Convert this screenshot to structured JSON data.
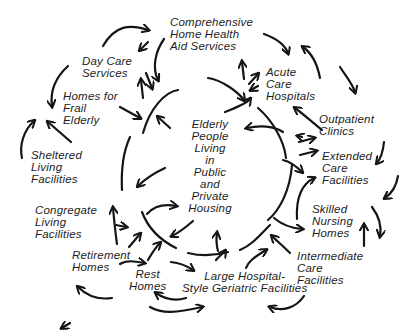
{
  "diagram": {
    "title": "",
    "center_node": {
      "id": "elderly-people",
      "lines": [
        "Elderly",
        "People",
        "Living",
        "in",
        "Public",
        "and",
        "Private",
        "Housing"
      ]
    },
    "nodes": [
      {
        "id": "comprehensive-home-health",
        "lines": [
          "Comprehensive",
          "Home Health",
          "Aid Services"
        ]
      },
      {
        "id": "day-care-services",
        "lines": [
          "Day Care",
          "Services"
        ]
      },
      {
        "id": "homes-for-frail-elderly",
        "lines": [
          "Homes for",
          "Frail",
          "Elderly"
        ]
      },
      {
        "id": "acute-care-hospitals",
        "lines": [
          "Acute",
          "Care",
          "Hospitals"
        ]
      },
      {
        "id": "outpatient-clinics",
        "lines": [
          "Outpatient",
          "Clinics"
        ]
      },
      {
        "id": "extended-care-facilities",
        "lines": [
          "Extended",
          "Care",
          "Facilities"
        ]
      },
      {
        "id": "sheltered-living-facilities",
        "lines": [
          "Sheltered",
          "Living",
          "Facilities"
        ]
      },
      {
        "id": "congregate-living-facilities",
        "lines": [
          "Congregate",
          "Living",
          "Facilities"
        ]
      },
      {
        "id": "skilled-nursing-homes",
        "lines": [
          "Skilled",
          "Nursing",
          "Homes"
        ]
      },
      {
        "id": "retirement-homes",
        "lines": [
          "Retirement",
          "Homes"
        ]
      },
      {
        "id": "rest-homes",
        "lines": [
          "Rest",
          "Homes"
        ]
      },
      {
        "id": "intermediate-care-facilities",
        "lines": [
          "Intermediate",
          "Care",
          "Facilities"
        ]
      },
      {
        "id": "large-hospital-style-geriatric-facilities",
        "lines": [
          "Large Hospital-",
          "Style Geriatric Facilities"
        ]
      }
    ],
    "stroke_color": "#151515",
    "text_color": "#1c1c1c",
    "background": "#ffffff"
  }
}
